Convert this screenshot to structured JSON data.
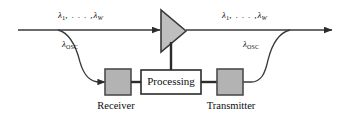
{
  "diagram": {
    "colors": {
      "line": "#3a3a3a",
      "box_fill": "#b3b3b3",
      "box_stroke": "#4d4d4d",
      "amplifier_fill": "#bfbfbf",
      "amplifier_stroke": "#3a3a3a",
      "processing_fill": "#ffffff",
      "processing_stroke": "#2b2b2b",
      "text": "#111111",
      "background": "#ffffff"
    },
    "labels": {
      "lambda_in": {
        "lambda": "λ",
        "first_sub": "1",
        "dots": ", . . . ,",
        "lambda_last": "λ",
        "last_sub": "W"
      },
      "lambda_out": {
        "lambda": "λ",
        "first_sub": "1",
        "dots": ", . . . ,",
        "lambda_last": "λ",
        "last_sub": "W"
      },
      "osc_drop": {
        "lambda": "λ",
        "sub": "OSC"
      },
      "osc_add": {
        "lambda": "λ",
        "sub": "OSC"
      }
    },
    "nodes": {
      "amplifier": {
        "name": "optical-amplifier",
        "label": ""
      },
      "receiver": {
        "label": "",
        "caption": "Receiver"
      },
      "processing": {
        "label": "Processing",
        "caption": ""
      },
      "transmitter": {
        "label": "",
        "caption": "Transmitter"
      }
    },
    "flow": {
      "input_arrow": "arrow-right",
      "output_arrow": "arrow-right",
      "drop_arrow": "arrow-right"
    }
  }
}
